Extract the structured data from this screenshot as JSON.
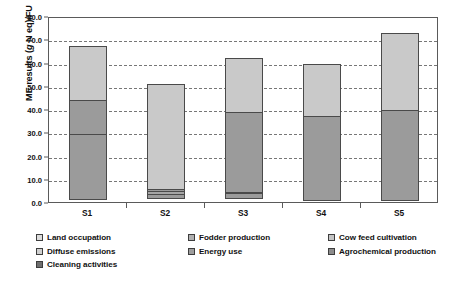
{
  "chart_data": {
    "type": "bar",
    "stacked": true,
    "title": "",
    "xlabel": "",
    "ylabel": "ME results (g N eq)/FU",
    "ylabel_parts": {
      "prefix": "ME results (",
      "italic": "g",
      "suffix": " N eq)/FU"
    },
    "categories": [
      "S1",
      "S2",
      "S3",
      "S4",
      "S5"
    ],
    "ylim": [
      0.0,
      80.0
    ],
    "ytick_step": 10.0,
    "ytick_labels": [
      "0.0",
      "10.0",
      "20.0",
      "30.0",
      "40.0",
      "50.0",
      "60.0",
      "70.0",
      "80.0"
    ],
    "grid": true,
    "grid_style": "dashed-horizontal",
    "legend_position": "bottom",
    "series": [
      {
        "name": "Land occupation",
        "color": "#d3d3d3",
        "values": [
          23.5,
          45.6,
          23.7,
          22.5,
          33.6
        ]
      },
      {
        "name": "Fodder production",
        "color": "#a8a8a8",
        "values": [
          0.0,
          0.0,
          0.0,
          0.0,
          0.0
        ]
      },
      {
        "name": "Cow feed cultivation",
        "color": "#bdbdbd",
        "values": [
          0.0,
          0.0,
          0.0,
          0.0,
          0.0
        ]
      },
      {
        "name": "Diffuse emissions",
        "color": "#c6c6c6",
        "values": [
          15.0,
          1.3,
          0.0,
          0.0,
          0.0
        ]
      },
      {
        "name": "Energy use",
        "color": "#9a9a9a",
        "values": [
          0.0,
          1.7,
          1.0,
          0.0,
          0.0
        ]
      },
      {
        "name": "Agrochemical production",
        "color": "#8f8f8f",
        "values": [
          0.0,
          0.0,
          34.9,
          0.0,
          0.0
        ]
      },
      {
        "name": "Cleaning activities",
        "color": "#9b9b9b",
        "values": [
          28.5,
          2.2,
          3.4,
          36.7,
          39.1
        ]
      }
    ],
    "totals": [
      67.0,
      50.8,
      62.0,
      59.2,
      72.7
    ],
    "bars": [
      {
        "category": "S1",
        "total": 67.0,
        "segments": [
          {
            "series": "Cleaning activities",
            "from": 0.0,
            "to": 28.5,
            "value": 28.5,
            "color": "#9b9b9b"
          },
          {
            "series": "Diffuse emissions",
            "from": 28.5,
            "to": 43.5,
            "value": 15.0,
            "color": "#9b9b9b"
          },
          {
            "series": "Land occupation",
            "from": 43.5,
            "to": 67.0,
            "value": 23.5,
            "color": "#c9c9c9"
          }
        ]
      },
      {
        "category": "S2",
        "total": 50.8,
        "segments": [
          {
            "series": "Cleaning activities",
            "from": 0.0,
            "to": 2.2,
            "value": 2.2,
            "color": "#9b9b9b"
          },
          {
            "series": "Energy use",
            "from": 2.2,
            "to": 3.9,
            "value": 1.7,
            "color": "#a5a5a5"
          },
          {
            "series": "Diffuse emissions",
            "from": 3.9,
            "to": 5.2,
            "value": 1.3,
            "color": "#9b9b9b"
          },
          {
            "series": "Land occupation",
            "from": 5.2,
            "to": 50.8,
            "value": 45.6,
            "color": "#c9c9c9"
          }
        ]
      },
      {
        "category": "S3",
        "total": 62.0,
        "segments": [
          {
            "series": "Cleaning activities",
            "from": 0.0,
            "to": 2.4,
            "value": 2.4,
            "color": "#9b9b9b"
          },
          {
            "series": "Energy use",
            "from": 2.4,
            "to": 3.4,
            "value": 1.0,
            "color": "#a5a5a5"
          },
          {
            "series": "Agrochemical production",
            "from": 3.4,
            "to": 38.3,
            "value": 34.9,
            "color": "#9b9b9b"
          },
          {
            "series": "Land occupation",
            "from": 38.3,
            "to": 62.0,
            "value": 23.7,
            "color": "#c9c9c9"
          }
        ]
      },
      {
        "category": "S4",
        "total": 59.2,
        "segments": [
          {
            "series": "Cleaning activities",
            "from": 0.0,
            "to": 36.7,
            "value": 36.7,
            "color": "#9b9b9b"
          },
          {
            "series": "Land occupation",
            "from": 36.7,
            "to": 59.2,
            "value": 22.5,
            "color": "#c9c9c9"
          }
        ]
      },
      {
        "category": "S5",
        "total": 72.7,
        "segments": [
          {
            "series": "Cleaning activities",
            "from": 0.0,
            "to": 39.1,
            "value": 39.1,
            "color": "#9b9b9b"
          },
          {
            "series": "Land occupation",
            "from": 39.1,
            "to": 72.7,
            "value": 33.6,
            "color": "#c9c9c9"
          }
        ]
      }
    ]
  },
  "legend": {
    "entries": [
      {
        "label": "Land occupation",
        "color": "#dcdcdc"
      },
      {
        "label": "Fodder production",
        "color": "#b0b0b0"
      },
      {
        "label": "Cow feed cultivation",
        "color": "#c4c4c4"
      },
      {
        "label": "Diffuse emissions",
        "color": "#d0d0d0"
      },
      {
        "label": "Energy use",
        "color": "#9e9e9e"
      },
      {
        "label": "Agrochemical production",
        "color": "#8c8c8c"
      },
      {
        "label": "Cleaning activities",
        "color": "#6e6e6e"
      }
    ]
  }
}
